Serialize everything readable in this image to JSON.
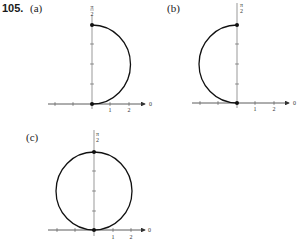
{
  "problem": {
    "number": "105.",
    "parts": [
      {
        "label": "(a)",
        "description": "right semicircle from origin to r=2 at theta=pi/2"
      },
      {
        "label": "(b)",
        "description": "left semicircle from origin to r=2 at theta=pi/2"
      },
      {
        "label": "(c)",
        "description": "full circle through origin with top point at r=2 on pi/2 axis"
      }
    ]
  },
  "axes": {
    "vertical_label": "π/2",
    "vertical_label_num": "π",
    "vertical_label_den": "2",
    "polar_axis_label": "0",
    "tick_labels": [
      "1",
      "2"
    ]
  },
  "colors": {
    "curve": "#111111",
    "axis": "#333333",
    "background": "#ffffff"
  }
}
